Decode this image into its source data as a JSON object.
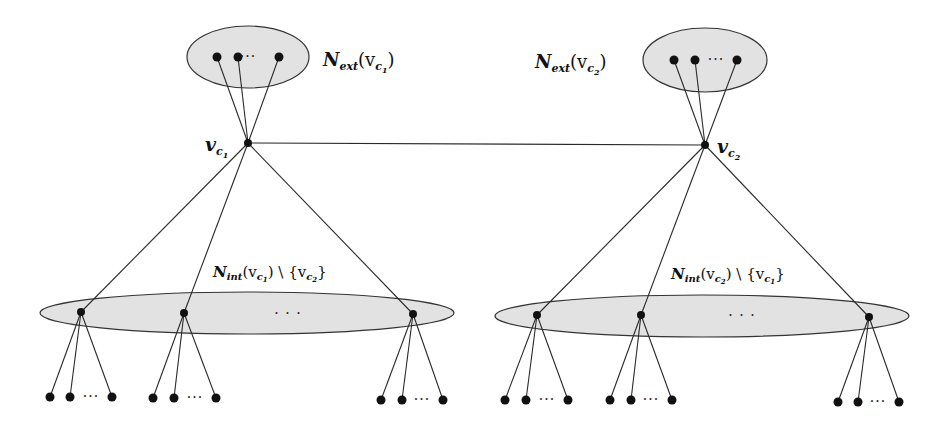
{
  "diagram": {
    "colors": {
      "set_fill": "#e2e2e2",
      "set_stroke": "#333333",
      "node": "#111111",
      "edge": "#2a2a2a"
    },
    "centers": [
      {
        "id": "vc1",
        "label_main": "v",
        "label_sub": "c",
        "label_subsub": "1"
      },
      {
        "id": "vc2",
        "label_main": "v",
        "label_sub": "c",
        "label_subsub": "2"
      }
    ],
    "sets": {
      "ext1": {
        "label_main": "N",
        "label_sub": "ext",
        "label_arg": "(v",
        "label_arg_sub": "c",
        "label_arg_subsub": "1",
        "label_close": ")",
        "visible_nodes": 3,
        "ellipsis": "···"
      },
      "ext2": {
        "label_main": "N",
        "label_sub": "ext",
        "label_arg": "(v",
        "label_arg_sub": "c",
        "label_arg_subsub": "2",
        "label_close": ")",
        "visible_nodes": 3,
        "ellipsis": "···"
      },
      "int1": {
        "label_main": "N",
        "label_sub": "int",
        "label_arg": "(v",
        "label_arg_sub": "c",
        "label_arg_subsub": "1",
        "label_rest": ") \\ {v",
        "label_rest_sub": "c",
        "label_rest_subsub": "2",
        "label_close": "}",
        "visible_nodes": 3,
        "ellipsis": "· · ·"
      },
      "int2": {
        "label_main": "N",
        "label_sub": "int",
        "label_arg": "(v",
        "label_arg_sub": "c",
        "label_arg_subsub": "2",
        "label_rest": ") \\ {v",
        "label_rest_sub": "c",
        "label_rest_subsub": "1",
        "label_close": "}",
        "visible_nodes": 3,
        "ellipsis": "· · ·"
      }
    },
    "leaf_ellipsis": "···",
    "leaves_per_internal_node": 3
  }
}
